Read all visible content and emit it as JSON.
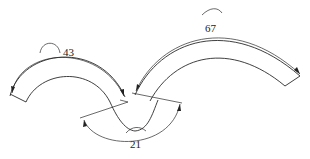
{
  "diagram": {
    "type": "arc-length dimensioned curved strip",
    "dimensions": [
      {
        "id": "left-arc",
        "label": "43",
        "symbol": "arc-length"
      },
      {
        "id": "right-arc",
        "label": "67",
        "symbol": "arc-length"
      },
      {
        "id": "bottom-arc",
        "label": "21",
        "symbol": "arc-length"
      }
    ],
    "colors": {
      "stroke": "#2a2a2a",
      "background": "#ffffff"
    }
  }
}
